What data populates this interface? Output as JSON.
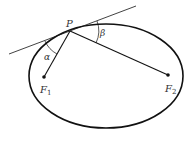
{
  "diagram": {
    "labels": {
      "point": "P",
      "focus1": "F",
      "focus1_sub": "1",
      "focus2": "F",
      "focus2_sub": "2",
      "alpha": "α",
      "beta": "β"
    },
    "colors": {
      "stroke": "#111111",
      "text": "#333333",
      "background": "#ffffff"
    }
  }
}
